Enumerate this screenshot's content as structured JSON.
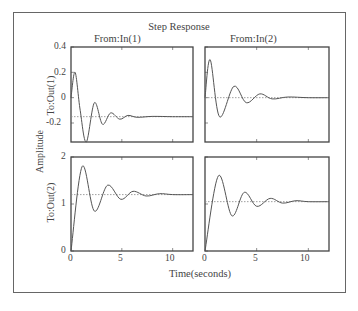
{
  "chart_data": {
    "type": "line",
    "title": "Step Response",
    "xlabel": "Time(seconds)",
    "ylabel": "Amplitude",
    "column_titles": [
      "From:In(1)",
      "From:In(2)"
    ],
    "row_titles": [
      "To:Out(1)",
      "To:Out(2)"
    ],
    "xlim": [
      0,
      12
    ],
    "xticks": [
      0,
      5,
      10
    ],
    "grid": false,
    "panels": [
      {
        "row": 0,
        "col": 0,
        "ylim": [
          -0.35,
          0.4
        ],
        "yticks": [
          0.4,
          0.2,
          0,
          -0.2
        ],
        "final_value": -0.15,
        "points": [
          [
            0,
            0
          ],
          [
            0.4,
            0.2
          ],
          [
            0.9,
            -0.1
          ],
          [
            1.5,
            -0.36
          ],
          [
            2.3,
            -0.04
          ],
          [
            3.1,
            -0.21
          ],
          [
            3.9,
            -0.12
          ],
          [
            4.8,
            -0.17
          ],
          [
            5.6,
            -0.14
          ],
          [
            6.5,
            -0.155
          ],
          [
            8,
            -0.148
          ],
          [
            10,
            -0.15
          ],
          [
            12,
            -0.15
          ]
        ]
      },
      {
        "row": 0,
        "col": 1,
        "ylim": [
          -0.35,
          0.4
        ],
        "yticks": [
          0.4,
          0.2,
          0,
          -0.2
        ],
        "final_value": 0,
        "points": [
          [
            0,
            0
          ],
          [
            0.5,
            0.3
          ],
          [
            1.4,
            -0.15
          ],
          [
            2.8,
            0.09
          ],
          [
            4.0,
            -0.04
          ],
          [
            5.3,
            0.03
          ],
          [
            6.5,
            -0.01
          ],
          [
            8,
            0.005
          ],
          [
            10,
            0
          ],
          [
            12,
            0
          ]
        ]
      },
      {
        "row": 1,
        "col": 0,
        "ylim": [
          0,
          2
        ],
        "yticks": [
          2,
          1,
          0
        ],
        "final_value": 1.2,
        "points": [
          [
            0,
            0
          ],
          [
            1.1,
            1.8
          ],
          [
            2.3,
            0.85
          ],
          [
            3.6,
            1.4
          ],
          [
            4.9,
            1.1
          ],
          [
            6.1,
            1.27
          ],
          [
            7.4,
            1.17
          ],
          [
            8.7,
            1.22
          ],
          [
            10,
            1.2
          ],
          [
            12,
            1.2
          ]
        ]
      },
      {
        "row": 1,
        "col": 1,
        "ylim": [
          0,
          2
        ],
        "yticks": [
          2,
          1,
          0
        ],
        "final_value": 1.05,
        "points": [
          [
            0,
            0
          ],
          [
            1.3,
            1.6
          ],
          [
            2.6,
            0.75
          ],
          [
            3.8,
            1.25
          ],
          [
            5.0,
            0.95
          ],
          [
            6.3,
            1.12
          ],
          [
            7.5,
            1.02
          ],
          [
            8.8,
            1.07
          ],
          [
            10,
            1.05
          ],
          [
            12,
            1.05
          ]
        ]
      }
    ]
  },
  "labels": {
    "title": "Step Response",
    "col1": "From:In(1)",
    "col2": "From:In(2)",
    "row1": "To:Out(1)",
    "row2": "To:Out(2)",
    "ylabel": "Amplitude",
    "xlabel": "Time(seconds)",
    "ticks_top": [
      "0.4",
      "0.2",
      "0",
      "-0.2"
    ],
    "ticks_bottom": [
      "2",
      "1",
      "0"
    ],
    "ticks_x": [
      "0",
      "5",
      "10"
    ]
  },
  "colors": {
    "line": "#555555",
    "axes": "#444444",
    "steady": "#888888"
  }
}
